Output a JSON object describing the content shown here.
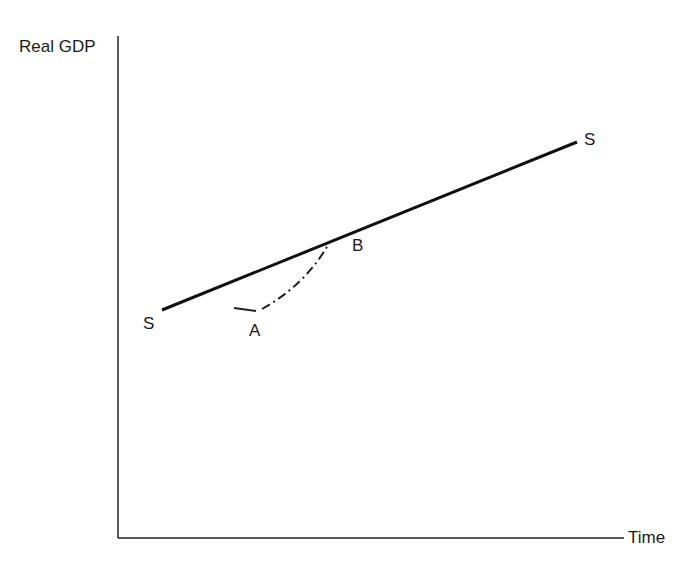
{
  "diagram": {
    "type": "line-diagram",
    "y_axis_label": "Real GDP",
    "x_axis_label": "Time",
    "trend_line": {
      "label_start": "S",
      "label_end": "S",
      "description": "Long-run growth path (solid line)"
    },
    "adjustment_path": {
      "start_point_label": "A",
      "end_point_label": "B",
      "style": "dash-dot",
      "description": "Recovery path from A back to trend at B"
    },
    "colors": {
      "line": "#111111",
      "text": "#1a1a1a",
      "background": "#ffffff"
    }
  }
}
